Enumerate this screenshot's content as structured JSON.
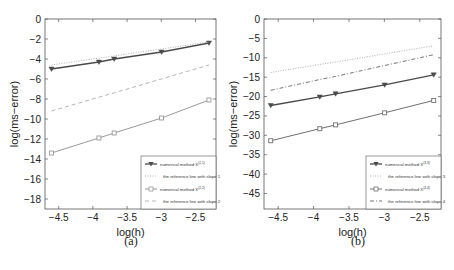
{
  "chart_data": [
    {
      "type": "line",
      "panel": "(a)",
      "xlabel": "log(h)",
      "ylabel": "log(ms−error)",
      "xlim": [
        -4.7,
        -2.2
      ],
      "ylim": [
        -19,
        0
      ],
      "xticks": [
        -4.5,
        -4,
        -3.5,
        -3,
        -2.5
      ],
      "xtick_labels": [
        "−4.5",
        "−4",
        "−3.5",
        "−3",
        "−2.5"
      ],
      "yticks": [
        0,
        -2,
        -4,
        -6,
        -8,
        -10,
        -12,
        -14,
        -16,
        -18
      ],
      "ytick_labels": [
        "0",
        "−2",
        "−4",
        "−6",
        "−8",
        "−10",
        "−12",
        "−14",
        "−16",
        "−18"
      ],
      "x": [
        -4.605,
        -3.912,
        -3.689,
        -2.996,
        -2.303
      ],
      "series": [
        {
          "name": "numerical method X^(1,1)",
          "label": "numerical method X",
          "sup": "(1,1)",
          "style": "solid-dark",
          "marker": "triangle-down",
          "values": [
            -5.0,
            -4.3,
            -4.0,
            -3.3,
            -2.4
          ]
        },
        {
          "name": "the reference line with slope 1",
          "label": "the reference line with slope 1",
          "style": "dotted",
          "values": [
            -4.6,
            -3.91,
            -3.69,
            -3.0,
            -2.3
          ]
        },
        {
          "name": "numerical method X^(2,2)",
          "label": "numerical method X",
          "sup": "(2,2)",
          "style": "solid-light",
          "marker": "square",
          "values": [
            -13.4,
            -11.9,
            -11.4,
            -9.9,
            -8.1
          ]
        },
        {
          "name": "the reference line with slope 2",
          "label": "the reference line with slope 2",
          "style": "dashed",
          "values": [
            -9.2,
            -7.82,
            -7.38,
            -5.99,
            -4.6
          ]
        }
      ],
      "legend_position": "lower right",
      "grid": false
    },
    {
      "type": "line",
      "panel": "(b)",
      "xlabel": "log(h)",
      "ylabel": "log(ms−error)",
      "xlim": [
        -4.7,
        -2.2
      ],
      "ylim": [
        -49,
        0
      ],
      "xticks": [
        -4.5,
        -4,
        -3.5,
        -3,
        -2.5
      ],
      "xtick_labels": [
        "−4.5",
        "−4",
        "−3.5",
        "−3",
        "−2.5"
      ],
      "yticks": [
        0,
        -5,
        -10,
        -15,
        -20,
        -25,
        -30,
        -35,
        -40,
        -45
      ],
      "ytick_labels": [
        "0",
        "−5",
        "−10",
        "−15",
        "−20",
        "−25",
        "−30",
        "−35",
        "−40",
        "−45"
      ],
      "x": [
        -4.605,
        -3.912,
        -3.689,
        -2.996,
        -2.303
      ],
      "series": [
        {
          "name": "numerical method X^(3,3)",
          "label": "numerical method X",
          "sup": "(3,3)",
          "style": "solid-dark",
          "marker": "triangle-down",
          "values": [
            -22.3,
            -20.1,
            -19.3,
            -17.0,
            -14.4
          ]
        },
        {
          "name": "the reference line with slope 3",
          "label": "the reference line with slope 3",
          "style": "dotted",
          "values": [
            -13.8,
            -11.7,
            -11.1,
            -9.0,
            -6.9
          ]
        },
        {
          "name": "numerical method X^(4,4)",
          "label": "numerical method X",
          "sup": "(4,4)",
          "style": "solid-mid",
          "marker": "square",
          "values": [
            -31.4,
            -28.3,
            -27.3,
            -24.2,
            -21.0
          ]
        },
        {
          "name": "the reference line with slope 4",
          "label": "the reference line with slope 4",
          "style": "dashdot",
          "values": [
            -18.4,
            -15.6,
            -14.8,
            -12.0,
            -9.2
          ]
        }
      ],
      "legend_position": "lower right",
      "grid": false
    }
  ],
  "captions": [
    "(a)",
    "(b)"
  ],
  "colors": {
    "dark": "#4a4a4a",
    "light": "#9a9a9a",
    "mid": "#707070",
    "axis": "#555555"
  }
}
